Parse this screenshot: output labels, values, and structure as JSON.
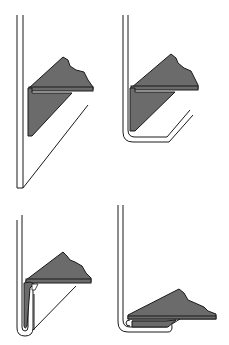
{
  "diagram": {
    "type": "process-illustration",
    "colors": {
      "background": "#ffffff",
      "line": "#1a1a1a",
      "die_fill": "#6b6b6b"
    },
    "panels": [
      {
        "id": "step-1",
        "position": "top-left",
        "description": "flat sheet angled against vertical wall with angle die"
      },
      {
        "id": "step-2",
        "position": "top-right",
        "description": "sheet bent 90 degrees around die"
      },
      {
        "id": "step-3",
        "position": "bottom-left",
        "description": "flange folded upward beside die"
      },
      {
        "id": "step-4",
        "position": "bottom-right",
        "description": "closed hem flattened under die"
      }
    ]
  }
}
